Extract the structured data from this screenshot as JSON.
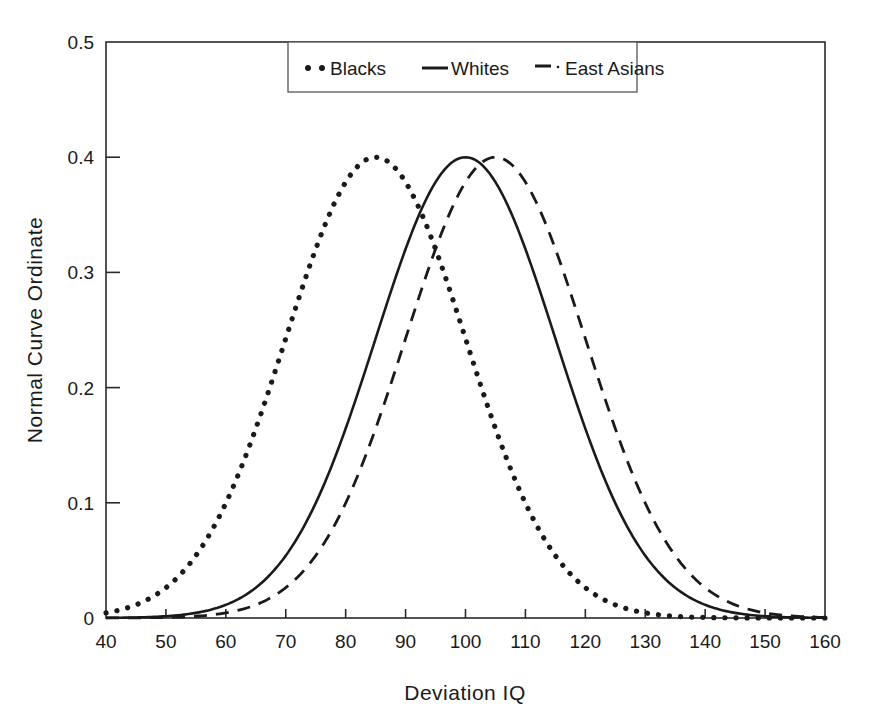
{
  "chart_data": {
    "type": "line",
    "title": "",
    "xlabel": "Deviation IQ",
    "ylabel": "Normal Curve Ordinate",
    "xlim": [
      40,
      160
    ],
    "ylim": [
      0,
      0.5
    ],
    "xticks": [
      40,
      50,
      60,
      70,
      80,
      90,
      100,
      110,
      120,
      130,
      140,
      150,
      160
    ],
    "yticks": [
      0,
      0.1,
      0.2,
      0.3,
      0.4,
      0.5
    ],
    "xtick_labels": [
      "40",
      "50",
      "60",
      "70",
      "80",
      "90",
      "100",
      "110",
      "120",
      "130",
      "140",
      "150",
      "160"
    ],
    "ytick_labels": [
      "0",
      "0.1",
      "0.2",
      "0.3",
      "0.4",
      "0.5"
    ],
    "grid": false,
    "legend_position": "top-center",
    "peak_ordinate": 0.4,
    "sd": 15,
    "series": [
      {
        "name": "Blacks",
        "style": "dotted",
        "mean": 85,
        "sd": 15,
        "peak_value": 0.4,
        "x": [
          40,
          45,
          50,
          55,
          60,
          65,
          70,
          75,
          80,
          85,
          90,
          95,
          100,
          105,
          110,
          115,
          120,
          125,
          130,
          135,
          140,
          145,
          150,
          155,
          160
        ],
        "values": [
          0.0177,
          0.0328,
          0.0561,
          0.0889,
          0.1302,
          0.1762,
          0.2204,
          0.2547,
          0.272,
          0.2683,
          0.2444,
          0.2055,
          0.1595,
          0.1144,
          0.0758,
          0.0463,
          0.0261,
          0.0136,
          0.0066,
          0.0029,
          0.0012,
          0.0004,
          0.0001,
          0.0,
          0.0
        ]
      },
      {
        "name": "Whites",
        "style": "solid",
        "mean": 100,
        "sd": 15,
        "peak_value": 0.4,
        "x": [
          40,
          45,
          50,
          55,
          60,
          65,
          70,
          75,
          80,
          85,
          90,
          95,
          100,
          105,
          110,
          115,
          120,
          125,
          130,
          135,
          140,
          145,
          150,
          155,
          160
        ],
        "values": [
          0.0012,
          0.0029,
          0.0066,
          0.0136,
          0.0261,
          0.0463,
          0.0758,
          0.1144,
          0.1595,
          0.2055,
          0.2444,
          0.2683,
          0.272,
          0.2547,
          0.2204,
          0.1762,
          0.1302,
          0.0889,
          0.0561,
          0.0328,
          0.0177,
          0.0089,
          0.0041,
          0.0018,
          0.0007
        ]
      },
      {
        "name": "East Asians",
        "style": "dashed",
        "mean": 105,
        "sd": 15,
        "peak_value": 0.4,
        "x": [
          40,
          45,
          50,
          55,
          60,
          65,
          70,
          75,
          80,
          85,
          90,
          95,
          100,
          105,
          110,
          115,
          120,
          125,
          130,
          135,
          140,
          145,
          150,
          155,
          160
        ],
        "values": [
          0.0004,
          0.0012,
          0.0029,
          0.0066,
          0.0136,
          0.0261,
          0.0463,
          0.0758,
          0.1144,
          0.1595,
          0.2055,
          0.2444,
          0.2683,
          0.272,
          0.2547,
          0.2204,
          0.1762,
          0.1302,
          0.0889,
          0.0561,
          0.0328,
          0.0177,
          0.0089,
          0.0041,
          0.0018
        ]
      }
    ]
  },
  "legend": {
    "entries": [
      {
        "label": "Blacks",
        "marker": "dotted-marker"
      },
      {
        "label": "Whites",
        "marker": "solid-line-marker"
      },
      {
        "label": "East Asians",
        "marker": "dashed-line-marker"
      }
    ]
  },
  "colors": {
    "line": "#1a1a1a",
    "frame": "#2a2a2a",
    "background": "#ffffff"
  }
}
